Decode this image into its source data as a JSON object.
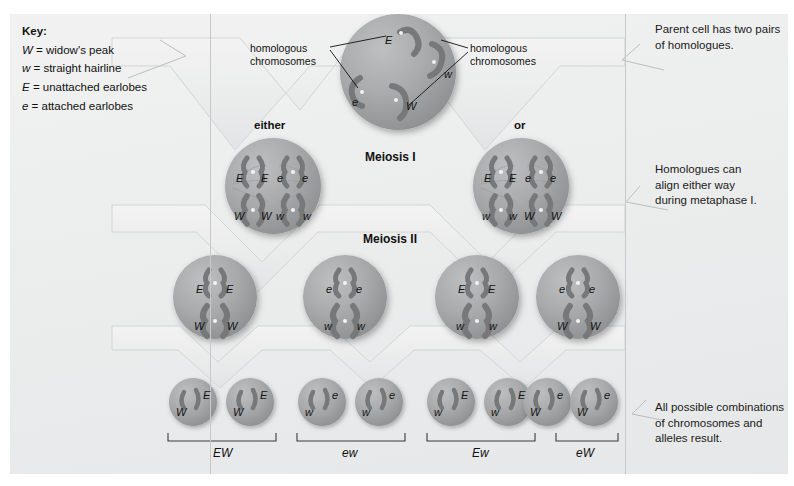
{
  "key": {
    "title": "Key:",
    "entries": [
      {
        "symbol": "W",
        "text": "= widow's peak"
      },
      {
        "symbol": "w",
        "text": "= straight hairline"
      },
      {
        "symbol": "E",
        "text": "= unattached earlobes"
      },
      {
        "symbol": "e",
        "text": "= attached earlobes"
      }
    ]
  },
  "annotations": {
    "homologous_left": "homologous\nchromosomes",
    "homologous_left_l1": "homologous",
    "homologous_left_l2": "chromosomes",
    "homologous_right_l1": "homologous",
    "homologous_right_l2": "chromosomes"
  },
  "captions": {
    "parent": "Parent cell has two pairs of homologues.",
    "parent_l1": "Parent cell has two pairs",
    "parent_l2": "of homologues.",
    "metaphase_l1": "Homologues can",
    "metaphase_l2": "align either way",
    "metaphase_l3": "during metaphase I.",
    "result_l1": "All possible combinations",
    "result_l2": "of chromosomes and",
    "result_l3": "alleles result."
  },
  "stages": {
    "meiosis1": "Meiosis I",
    "meiosis2": "Meiosis II",
    "either": "either",
    "or": "or"
  },
  "parent_cell": {
    "chromosomes": [
      {
        "allele": "E",
        "x": 62,
        "y": 18
      },
      {
        "allele": "w",
        "x": 104,
        "y": 46
      },
      {
        "allele": "e",
        "x": 30,
        "y": 72
      },
      {
        "allele": "W",
        "x": 76,
        "y": 80
      }
    ]
  },
  "meiosis1_cells": [
    {
      "id": "either",
      "top_alleles": [
        "E",
        "E",
        "e",
        "e"
      ],
      "bottom_alleles": [
        "W",
        "W",
        "w",
        "w"
      ]
    },
    {
      "id": "or",
      "top_alleles": [
        "E",
        "E",
        "e",
        "e"
      ],
      "bottom_alleles": [
        "w",
        "w",
        "W",
        "W"
      ]
    }
  ],
  "meiosis2_cells": [
    {
      "top": [
        "E",
        "E"
      ],
      "bottom": [
        "W",
        "W"
      ]
    },
    {
      "top": [
        "e",
        "e"
      ],
      "bottom": [
        "w",
        "w"
      ]
    },
    {
      "top": [
        "E",
        "E"
      ],
      "bottom": [
        "w",
        "w"
      ]
    },
    {
      "top": [
        "e",
        "e"
      ],
      "bottom": [
        "W",
        "W"
      ]
    }
  ],
  "gametes": [
    {
      "hair": "W",
      "ear": "E"
    },
    {
      "hair": "W",
      "ear": "E"
    },
    {
      "hair": "w",
      "ear": "e"
    },
    {
      "hair": "w",
      "ear": "e"
    },
    {
      "hair": "w",
      "ear": "E"
    },
    {
      "hair": "w",
      "ear": "E"
    },
    {
      "hair": "W",
      "ear": "e"
    },
    {
      "hair": "W",
      "ear": "e"
    }
  ],
  "bracket_labels": [
    "EW",
    "ew",
    "Ew",
    "eW"
  ],
  "colors": {
    "background": "#ebecec",
    "cell_fill": "#a9abad",
    "chromosome": "#7d7f81",
    "chevron": "#e9eaea",
    "text": "#111111"
  }
}
